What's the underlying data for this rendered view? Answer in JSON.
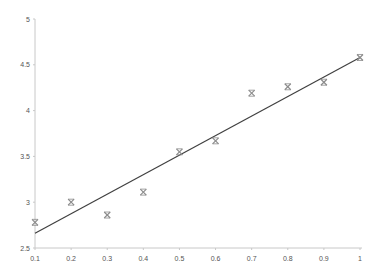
{
  "chart_data": {
    "type": "scatter",
    "title": "",
    "xlabel": "",
    "ylabel": "",
    "xlim": [
      0.1,
      1
    ],
    "ylim": [
      2.5,
      5
    ],
    "grid": false,
    "legend": null,
    "x_ticks": [
      "0.1",
      "0.2",
      "0.3",
      "0.4",
      "0.5",
      "0.6",
      "0.7",
      "0.8",
      "0.9",
      "1"
    ],
    "y_ticks": [
      "2.5",
      "3",
      "3.5",
      "4",
      "4.5",
      "5"
    ],
    "series": [
      {
        "name": "Data",
        "kind": "scatter",
        "marker": "star",
        "color": "#8c8c8c",
        "x": [
          0.1,
          0.2,
          0.3,
          0.4,
          0.5,
          0.6,
          0.7,
          0.8,
          0.9,
          1.0
        ],
        "y": [
          2.78,
          3.0,
          2.86,
          3.11,
          3.55,
          3.67,
          4.19,
          4.26,
          4.31,
          4.58
        ]
      },
      {
        "name": "Linear fit",
        "kind": "line",
        "color": "#404040",
        "x": [
          0.1,
          1.0
        ],
        "y": [
          2.66,
          4.58
        ]
      }
    ],
    "colors": {
      "axis": "#c8c8c8",
      "tick_label": "#555555",
      "marker": "#8c8c8c",
      "trendline": "#404040"
    }
  }
}
